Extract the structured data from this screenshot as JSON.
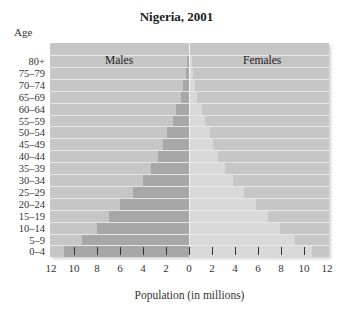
{
  "chart_data": {
    "type": "bar",
    "subtype": "population-pyramid",
    "title": "Nigeria, 2001",
    "ylabel": "Age",
    "xlabel": "Population (in millions)",
    "categories": [
      "80+",
      "75–79",
      "70–74",
      "65–69",
      "60–64",
      "55–59",
      "50–54",
      "45–49",
      "40–44",
      "35–39",
      "30–34",
      "25–29",
      "20–24",
      "15–19",
      "10–14",
      "5–9",
      "0–4"
    ],
    "series": [
      {
        "name": "Males",
        "side": "left",
        "color": "#a7a7a7",
        "values": [
          0.2,
          0.3,
          0.5,
          0.7,
          1.1,
          1.4,
          1.9,
          2.3,
          2.7,
          3.3,
          4.0,
          4.9,
          6.0,
          7.0,
          8.0,
          9.3,
          10.9
        ]
      },
      {
        "name": "Females",
        "side": "right",
        "color": "#d9d9d9",
        "values": [
          0.2,
          0.3,
          0.4,
          0.6,
          1.0,
          1.3,
          1.7,
          2.0,
          2.4,
          3.0,
          3.7,
          4.7,
          5.7,
          6.8,
          7.8,
          9.1,
          10.6
        ]
      }
    ],
    "xlim": [
      -12,
      12
    ],
    "x_ticks": [
      -12,
      -10,
      -8,
      -6,
      -4,
      -2,
      0,
      2,
      4,
      6,
      8,
      10,
      12
    ],
    "x_tick_labels": [
      "12",
      "10",
      "8",
      "6",
      "4",
      "2",
      "0",
      "2",
      "4",
      "6",
      "8",
      "10",
      "12"
    ],
    "legend": [
      "Males",
      "Females"
    ],
    "legend_position": "inside-top",
    "grid": false,
    "background_color": "#c6c6c6"
  },
  "labels": {
    "title": "Nigeria, 2001",
    "ylabel": "Age",
    "xlabel": "Population (in millions)",
    "males": "Males",
    "females": "Females"
  }
}
